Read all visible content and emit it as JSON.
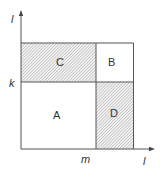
{
  "diagram": {
    "axes": {
      "y_label": "l",
      "x_label": "l",
      "y_tick_label": "k",
      "x_tick_label": "m"
    },
    "regions": [
      {
        "id": "A",
        "label": "A",
        "shaded": false,
        "position": "bottom-left"
      },
      {
        "id": "B",
        "label": "B",
        "shaded": false,
        "position": "top-right"
      },
      {
        "id": "C",
        "label": "C",
        "shaded": true,
        "position": "top-left"
      },
      {
        "id": "D",
        "label": "D",
        "shaded": true,
        "position": "bottom-right"
      }
    ],
    "colors": {
      "line": "#555555",
      "hatch": "#9a9a9a",
      "text": "#333333"
    }
  }
}
